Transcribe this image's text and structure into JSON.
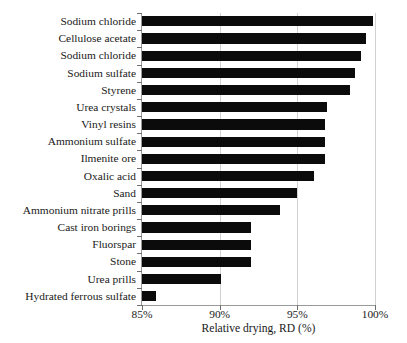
{
  "chart_data": {
    "type": "bar",
    "orientation": "horizontal",
    "title": "",
    "xlabel": "Relative drying, RD (%)",
    "ylabel": "",
    "xlim": [
      85,
      100
    ],
    "grid": true,
    "legend": false,
    "xtick_labels": [
      "85%",
      "90%",
      "95%",
      "100%"
    ],
    "xticks": [
      85,
      90,
      95,
      100
    ],
    "categories": [
      "Sodium chloride",
      "Cellulose acetate",
      "Sodium chloride",
      "Sodium sulfate",
      "Styrene",
      "Urea crystals",
      "Vinyl resins",
      "Ammonium sulfate",
      "Ilmenite ore",
      "Oxalic acid",
      "Sand",
      "Ammonium nitrate prills",
      "Cast iron borings",
      "Fluorspar",
      "Stone",
      "Urea prills",
      "Hydrated ferrous sulfate"
    ],
    "values": [
      99.9,
      99.4,
      99.1,
      98.7,
      98.4,
      96.9,
      96.8,
      96.8,
      96.8,
      96.1,
      95.0,
      93.9,
      92.0,
      92.0,
      92.0,
      90.1,
      85.9
    ],
    "bar_color": "#0b0b0b",
    "grid_color": "#d2d2d2",
    "axis_color": "#9a9a9a"
  }
}
